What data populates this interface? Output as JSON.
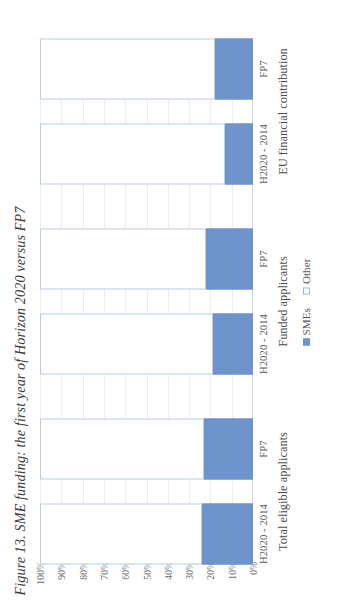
{
  "figure": {
    "caption": "Figure 13. SME funding: the first year of Horizon 2020 versus FP7"
  },
  "legend": {
    "position": "bottom-center",
    "items": [
      {
        "label": "SMEs",
        "color": "#6f93cb",
        "swatch": "filled-square-icon"
      },
      {
        "label": "Other",
        "color": "#ffffff",
        "swatch": "outlined-square-icon"
      }
    ]
  },
  "axes": {
    "y_ticks": [
      "0%",
      "10%",
      "20%",
      "30%",
      "40%",
      "50%",
      "60%",
      "70%",
      "80%",
      "90%",
      "100%"
    ],
    "y_tick_values": [
      0,
      10,
      20,
      30,
      40,
      50,
      60,
      70,
      80,
      90,
      100
    ],
    "category_ticks": [
      "H2020 - 2014",
      "FP7",
      "H2020 - 2014",
      "FP7",
      "H2020 - 2014",
      "FP7"
    ],
    "group_labels": [
      "Total eligible applicants",
      "Funded applicants",
      "EU financial contribution"
    ]
  },
  "chart_data": {
    "type": "bar",
    "subtype": "stacked-100-percent-column",
    "title": "Figure 13. SME funding: the first year of Horizon 2020 versus FP7",
    "xlabel": "",
    "ylabel": "",
    "ylim": [
      0,
      100
    ],
    "grid": true,
    "legend_position": "bottom-center",
    "categories": [
      "Total eligible applicants — H2020 - 2014",
      "Total eligible applicants — FP7",
      "Funded applicants — H2020 - 2014",
      "Funded applicants — FP7",
      "EU financial contribution — H2020 - 2014",
      "EU financial contribution — FP7"
    ],
    "groups": [
      {
        "name": "Total eligible applicants",
        "bars": [
          {
            "label": "H2020 - 2014",
            "SMEs": 24,
            "Other": 76
          },
          {
            "label": "FP7",
            "SMEs": 23,
            "Other": 77
          }
        ]
      },
      {
        "name": "Funded applicants",
        "bars": [
          {
            "label": "H2020 - 2014",
            "SMEs": 19,
            "Other": 81
          },
          {
            "label": "FP7",
            "SMEs": 22,
            "Other": 78
          }
        ]
      },
      {
        "name": "EU financial contribution",
        "bars": [
          {
            "label": "H2020 - 2014",
            "SMEs": 13,
            "Other": 87
          },
          {
            "label": "FP7",
            "SMEs": 18,
            "Other": 82
          }
        ]
      }
    ],
    "series": [
      {
        "name": "SMEs",
        "color": "#6f93cb",
        "values": [
          24,
          23,
          19,
          22,
          13,
          18
        ]
      },
      {
        "name": "Other",
        "color": "#ffffff",
        "values": [
          76,
          77,
          81,
          78,
          87,
          82
        ]
      }
    ]
  }
}
